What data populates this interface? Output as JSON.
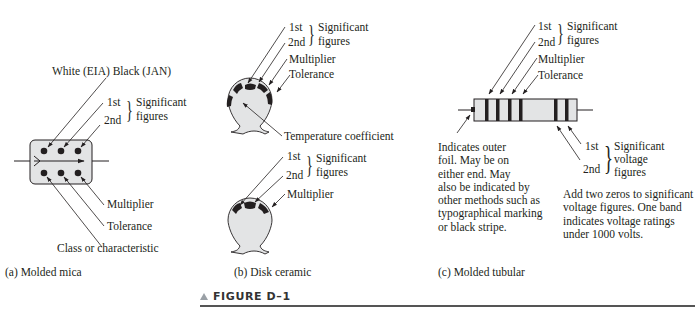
{
  "figure": {
    "label": "FIGURE D–1"
  },
  "panel_a": {
    "caption": "(a) Molded mica",
    "white_black": "White (EIA) Black (JAN)",
    "first": "1st",
    "second": "2nd",
    "sig_line1": "Significant",
    "sig_line2": "figures",
    "multiplier": "Multiplier",
    "tolerance": "Tolerance",
    "class": "Class or characteristic"
  },
  "panel_b": {
    "caption": "(b) Disk ceramic",
    "top": {
      "first": "1st",
      "second": "2nd",
      "sig_line1": "Significant",
      "sig_line2": "figures",
      "multiplier": "Multiplier",
      "tolerance": "Tolerance",
      "temp_coeff": "Temperature coefficient"
    },
    "bottom": {
      "first": "1st",
      "second": "2nd",
      "sig_line1": "Significant",
      "sig_line2": "figures",
      "multiplier": "Multiplier"
    }
  },
  "panel_c": {
    "caption": "(c) Molded tubular",
    "first": "1st",
    "second": "2nd",
    "sig_line1": "Significant",
    "sig_line2": "figures",
    "multiplier": "Multiplier",
    "tolerance": "Tolerance",
    "v_first": "1st",
    "v_second": "2nd",
    "v_sig_line1": "Significant",
    "v_sig_line2": "voltage",
    "v_sig_line3": "figures",
    "foil_note": "Indicates outer\nfoil.  May be on\neither end.  May\nalso be indicated by\nother methods such as\ntypographical marking\nor black stripe.",
    "voltage_note": "Add two zeros to significant\nvoltage figures.  One band\nindicates voltage ratings\nunder 1000 volts."
  },
  "colors": {
    "body_fill": "#e3e4e5",
    "ink": "#231f20"
  }
}
